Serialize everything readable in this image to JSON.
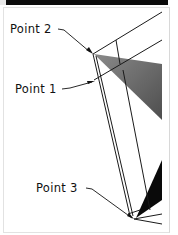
{
  "diagram": {
    "labels": [
      {
        "id": "point2",
        "text": "Point 2"
      },
      {
        "id": "point1",
        "text": "Point 1"
      },
      {
        "id": "point3",
        "text": "Point 3"
      }
    ],
    "colors": {
      "line": "#1a1a1a",
      "shade_gray": "#6a6a6a",
      "shade_dark": "#0a0a0a",
      "header_bar": "#0c0c0c"
    }
  }
}
